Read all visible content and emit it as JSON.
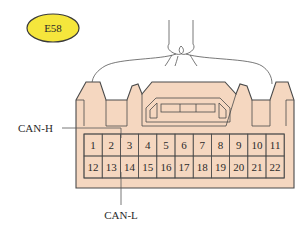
{
  "connector": {
    "id": "E58",
    "badge_color": "#f5e63c",
    "body_color": "#f5d7c0",
    "outline_color": "#4a4a4a",
    "pins_row1": [
      "1",
      "2",
      "3",
      "4",
      "5",
      "6",
      "7",
      "8",
      "9",
      "10",
      "11"
    ],
    "pins_row2": [
      "12",
      "13",
      "14",
      "15",
      "16",
      "17",
      "18",
      "19",
      "20",
      "21",
      "22"
    ]
  },
  "callouts": [
    {
      "label": "CAN-H",
      "pin": "3"
    },
    {
      "label": "CAN-L",
      "pin": "14"
    }
  ]
}
